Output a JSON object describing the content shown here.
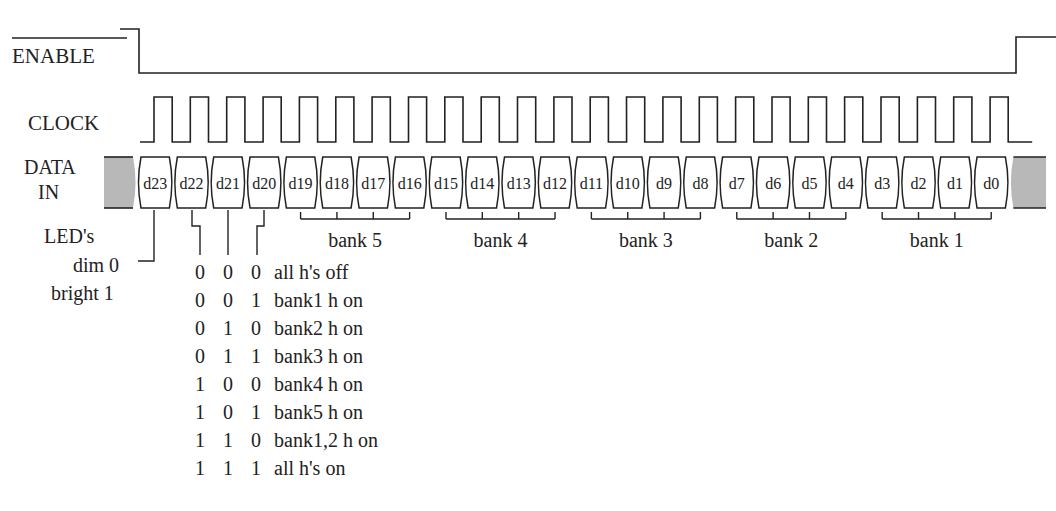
{
  "signals": {
    "enable": {
      "label": "ENABLE",
      "active_low": true
    },
    "clock": {
      "label": "CLOCK",
      "pulses": 24
    },
    "data_in": {
      "label_line1": "DATA",
      "label_line2": "IN"
    }
  },
  "data_bits": [
    "d23",
    "d22",
    "d21",
    "d20",
    "d19",
    "d18",
    "d17",
    "d16",
    "d15",
    "d14",
    "d13",
    "d12",
    "d11",
    "d10",
    "d9",
    "d8",
    "d7",
    "d6",
    "d5",
    "d4",
    "d3",
    "d2",
    "d1",
    "d0"
  ],
  "banks": [
    {
      "label": "bank 5",
      "bits": [
        "d19",
        "d18",
        "d17",
        "d16"
      ]
    },
    {
      "label": "bank 4",
      "bits": [
        "d15",
        "d14",
        "d13",
        "d12"
      ]
    },
    {
      "label": "bank 3",
      "bits": [
        "d11",
        "d10",
        "d9",
        "d8"
      ]
    },
    {
      "label": "bank 2",
      "bits": [
        "d7",
        "d6",
        "d5",
        "d4"
      ]
    },
    {
      "label": "bank 1",
      "bits": [
        "d3",
        "d2",
        "d1",
        "d0"
      ]
    }
  ],
  "led_legend": {
    "title": "LED's",
    "dim": "dim 0",
    "bright": "bright 1"
  },
  "truth_table": [
    {
      "d22": "0",
      "d21": "0",
      "d20": "0",
      "meaning": "all h's off"
    },
    {
      "d22": "0",
      "d21": "0",
      "d20": "1",
      "meaning": "bank1 h on"
    },
    {
      "d22": "0",
      "d21": "1",
      "d20": "0",
      "meaning": "bank2 h on"
    },
    {
      "d22": "0",
      "d21": "1",
      "d20": "1",
      "meaning": "bank3 h on"
    },
    {
      "d22": "1",
      "d21": "0",
      "d20": "0",
      "meaning": "bank4 h on"
    },
    {
      "d22": "1",
      "d21": "0",
      "d20": "1",
      "meaning": "bank5 h on"
    },
    {
      "d22": "1",
      "d21": "1",
      "d20": "0",
      "meaning": "bank1,2 h on"
    },
    {
      "d22": "1",
      "d21": "1",
      "d20": "1",
      "meaning": "all h's on"
    }
  ],
  "colors": {
    "line": "#222222",
    "idle_fill": "#b8b8b8",
    "cell_fill": "#ffffff"
  }
}
